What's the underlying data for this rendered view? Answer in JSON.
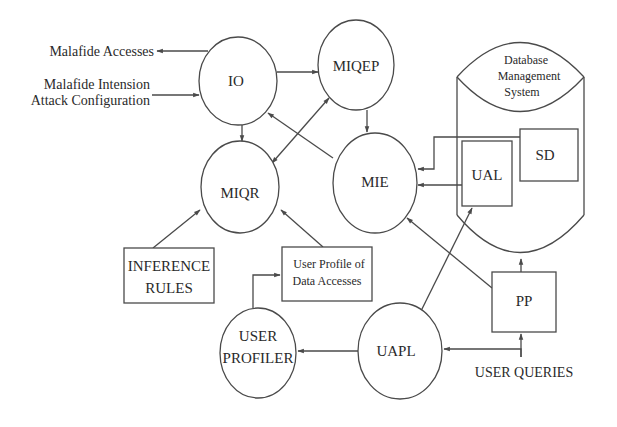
{
  "diagram": {
    "external": {
      "malafide_accesses": "Malafide Accesses",
      "malafide_intension_line1": "Malafide Intension",
      "malafide_intension_line2": "Attack Configuration",
      "user_queries": "USER QUERIES"
    },
    "nodes": {
      "io": "IO",
      "miqep": "MIQEP",
      "miqr": "MIQR",
      "mie": "MIE",
      "user_profiler_line1": "USER",
      "user_profiler_line2": "PROFILER",
      "uapl": "UAPL"
    },
    "boxes": {
      "inference_line1": "INFERENCE",
      "inference_line2": "RULES",
      "profile_line1": "User Profile of",
      "profile_line2": "Data Accesses",
      "pp": "PP",
      "ual": "UAL",
      "sd": "SD"
    },
    "dbms": {
      "line1": "Database",
      "line2": "Management",
      "line3": "System"
    },
    "edges": [
      {
        "from": "IO",
        "to": "Malafide Accesses"
      },
      {
        "from": "Malafide Intension Attack Configuration",
        "to": "IO"
      },
      {
        "from": "IO",
        "to": "MIQEP"
      },
      {
        "from": "IO",
        "to": "MIQR"
      },
      {
        "from": "MIQEP",
        "to": "MIE"
      },
      {
        "from": "MIQEP",
        "to": "MIQR",
        "bidirectional": true
      },
      {
        "from": "MIE",
        "to": "IO"
      },
      {
        "from": "SD",
        "to": "MIE"
      },
      {
        "from": "UAL",
        "to": "MIE"
      },
      {
        "from": "PP",
        "to": "MIE"
      },
      {
        "from": "PP",
        "to": "Database Management System"
      },
      {
        "from": "UAPL",
        "to": "UAL"
      },
      {
        "from": "UAPL",
        "to": "USER PROFILER"
      },
      {
        "from": "USER QUERIES",
        "to": "UAPL"
      },
      {
        "from": "USER QUERIES",
        "to": "PP"
      },
      {
        "from": "USER PROFILER",
        "to": "User Profile of Data Accesses"
      },
      {
        "from": "INFERENCE RULES",
        "to": "MIQR"
      },
      {
        "from": "User Profile of Data Accesses",
        "to": "MIQR"
      }
    ]
  }
}
